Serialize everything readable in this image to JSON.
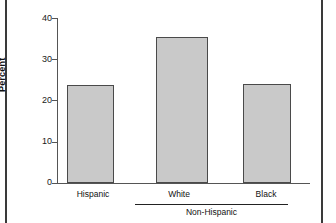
{
  "chart_data": {
    "type": "bar",
    "title": "",
    "subtitle": "",
    "xlabel": "",
    "ylabel": "Percent",
    "categories": [
      "Hispanic",
      "White",
      "Black"
    ],
    "values": [
      23.8,
      35.4,
      24.0
    ],
    "ylim": [
      0,
      40
    ],
    "yticks": [
      0,
      10,
      20,
      30,
      40
    ],
    "ytick_labels": [
      "0",
      "10",
      "20",
      "30",
      "40"
    ],
    "grid": false,
    "legend": null,
    "group_bracket": {
      "label": "Non-Hispanic",
      "covers": [
        "White",
        "Black"
      ]
    },
    "series": [
      {
        "name": "Percent",
        "values": [
          23.8,
          35.4,
          24.0
        ]
      }
    ],
    "colors": {
      "bar_fill": "#c9c9c9",
      "bar_edge": "#4a4a4a",
      "axis": "#555555",
      "text": "#111111",
      "frame_rule": "#3a3a3a",
      "background": "#ffffff"
    }
  },
  "axis": {
    "y_tick_0": "0",
    "y_tick_10": "10",
    "y_tick_20": "20",
    "y_tick_30": "30",
    "y_tick_40": "40",
    "y_title": "Percent"
  },
  "categories": {
    "c0": "Hispanic",
    "c1": "White",
    "c2": "Black"
  },
  "group": {
    "label": "Non-Hispanic"
  }
}
